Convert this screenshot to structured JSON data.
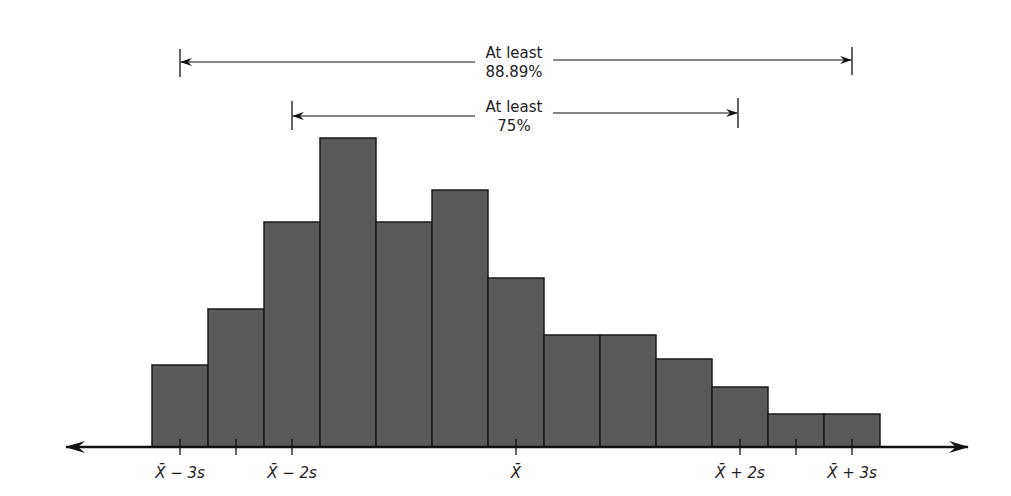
{
  "chart_data": {
    "type": "bar",
    "subtype": "histogram",
    "title": "",
    "xlabel": "",
    "ylabel": "",
    "grid": false,
    "bar_color": "#5a5a5a",
    "bar_edge_color": "#1a1a1a",
    "values": [
      3,
      5,
      8,
      11,
      8,
      9.2,
      6,
      4,
      4,
      3.2,
      2.2,
      1.2,
      1.2
    ],
    "bin_edges_px": [
      152,
      208,
      264,
      320,
      376,
      432,
      488,
      544,
      600,
      656,
      712,
      768,
      824,
      880
    ],
    "bar_tops_px": [
      365,
      309,
      222,
      138,
      222,
      190,
      278,
      335,
      335,
      359,
      387,
      414,
      414
    ],
    "baseline_px": 447,
    "ticks": [
      {
        "x": 180,
        "label": "X̄ − 3s"
      },
      {
        "x": 236,
        "label": ""
      },
      {
        "x": 292,
        "label": "X̄ − 2s"
      },
      {
        "x": 516,
        "label": "X̄"
      },
      {
        "x": 740,
        "label": "X̄ + 2s"
      },
      {
        "x": 796,
        "label": ""
      },
      {
        "x": 852,
        "label": "X̄ + 3s"
      }
    ],
    "annotations": [
      {
        "from_x": 180,
        "to_x": 852,
        "y": 60,
        "line1": "At least",
        "line2": "88.89%",
        "range": "X̄ ± 3s"
      },
      {
        "from_x": 292,
        "to_x": 740,
        "y": 113,
        "line1": "At least",
        "line2": "75%",
        "range": "X̄ ± 2s"
      }
    ]
  },
  "labels": {
    "tick_m3s": "X̄ − 3s",
    "tick_m2s": "X̄ − 2s",
    "tick_mean": "X̄",
    "tick_p2s": "X̄ + 2s",
    "tick_p3s": "X̄ + 3s",
    "ann_outer_line1": "At least",
    "ann_outer_line2": "88.89%",
    "ann_inner_line1": "At least",
    "ann_inner_line2": "75%"
  }
}
